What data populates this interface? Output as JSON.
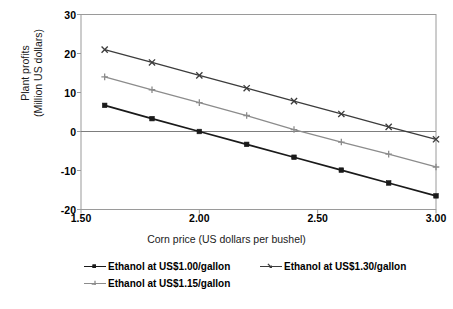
{
  "chart_data": {
    "type": "line",
    "title": "",
    "xlabel": "Corn price (US dollars per bushel)",
    "ylabel": "Plant profits (Million US dollars)",
    "ylabel_line1": "Plant profits",
    "ylabel_line2": "(Million US dollars)",
    "x": [
      1.6,
      1.8,
      2.0,
      2.2,
      2.4,
      2.6,
      2.8,
      3.0
    ],
    "xlim": [
      1.5,
      3.0
    ],
    "ylim": [
      -20,
      30
    ],
    "xticks": [
      "1.50",
      "2.00",
      "2.50",
      "3.00"
    ],
    "xtick_values": [
      1.5,
      2.0,
      2.5,
      3.0
    ],
    "yticks": [
      "30",
      "20",
      "10",
      "0",
      "-10",
      "-20"
    ],
    "ytick_values": [
      30,
      20,
      10,
      0,
      -10,
      -20
    ],
    "grid": false,
    "zero_line": true,
    "legend_position": "bottom",
    "series": [
      {
        "name": "Ethanol at US$1.00/gallon",
        "color": "#1a1a1a",
        "marker": "square",
        "values": [
          6.7,
          3.3,
          0.0,
          -3.3,
          -6.6,
          -9.9,
          -13.2,
          -16.5
        ]
      },
      {
        "name": "Ethanol at US$1.30/gallon",
        "color": "#3c3c3c",
        "marker": "cross",
        "values": [
          21.0,
          17.7,
          14.4,
          11.1,
          7.8,
          4.5,
          1.2,
          -2.0
        ]
      },
      {
        "name": "Ethanol at US$1.15/gallon",
        "color": "#8c8c8c",
        "marker": "plus",
        "values": [
          14.0,
          10.7,
          7.4,
          4.1,
          0.5,
          -2.7,
          -5.8,
          -9.1
        ]
      }
    ],
    "legend": [
      {
        "label": "Ethanol at US$1.00/gallon",
        "color": "#1a1a1a",
        "marker": "square"
      },
      {
        "label": "Ethanol at US$1.30/gallon",
        "color": "#3c3c3c",
        "marker": "cross"
      },
      {
        "label": "Ethanol at US$1.15/gallon",
        "color": "#8c8c8c",
        "marker": "plus"
      }
    ],
    "axis_color": "#9a9a9a",
    "zero_line_color": "#7d7d7d"
  }
}
